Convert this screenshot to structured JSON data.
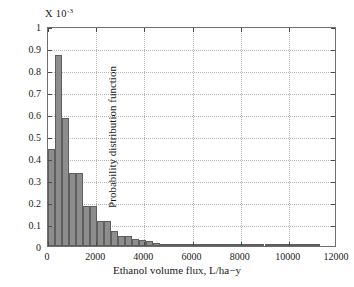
{
  "chart_data": {
    "type": "bar",
    "title": "",
    "subtitle": "",
    "scale_label": "X 10",
    "scale_exponent": "-3",
    "xlabel": "Ethanol volume flux, L/ha−y",
    "ylabel": "Probability distribution function",
    "xlim": [
      0,
      12000
    ],
    "ylim": [
      0,
      1
    ],
    "grid": true,
    "legend": null,
    "bar_color": "#8d8d8d",
    "bar_edge_color": "#5e5e5e",
    "axis_color": "#6e6e6e",
    "grid_color": "#b4b4b4",
    "bin_width": 290,
    "xticks": [
      0,
      2000,
      4000,
      6000,
      8000,
      10000,
      12000
    ],
    "xtick_labels": [
      "0",
      "2000",
      "4000",
      "6000",
      "8000",
      "10000",
      "12000"
    ],
    "yticks": [
      0,
      0.1,
      0.2,
      0.3,
      0.4,
      0.5,
      0.6,
      0.7,
      0.8,
      0.9,
      1
    ],
    "ytick_labels": [
      "0",
      "0.1",
      "0.2",
      "0.3",
      "0.4",
      "0.5",
      "0.6",
      "0.7",
      "0.8",
      "0.9",
      "1"
    ],
    "x": [
      145,
      435,
      725,
      1015,
      1305,
      1595,
      1885,
      2175,
      2465,
      2755,
      3045,
      3335,
      3625,
      3915,
      4205,
      4495,
      4785,
      5075,
      5365,
      5655,
      5945,
      6235,
      6525,
      6815,
      7105,
      7395,
      7685,
      7975,
      8265,
      8555,
      8845,
      9135,
      9425,
      9715,
      10005,
      10295,
      10585,
      10875,
      11165
    ],
    "values": [
      0.44,
      0.87,
      0.58,
      0.33,
      0.33,
      0.18,
      0.18,
      0.115,
      0.115,
      0.068,
      0.047,
      0.047,
      0.03,
      0.027,
      0.021,
      0.015,
      0.01,
      0.007,
      0.005,
      0.005,
      0.005,
      0.005,
      0.004,
      0.003,
      0.003,
      0.003,
      0.003,
      0.003,
      0.003,
      0.008,
      0.003,
      0.002,
      0.002,
      0.002,
      0.002,
      0.002,
      0.002,
      0.002,
      0.01
    ]
  }
}
